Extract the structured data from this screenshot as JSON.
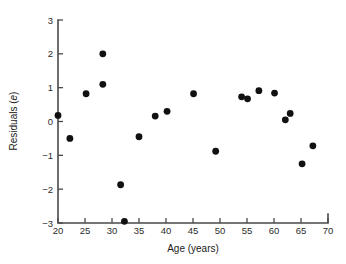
{
  "chart_data": {
    "type": "scatter",
    "title": "",
    "xlabel": "Age (years)",
    "ylabel": "Residuals (e)",
    "ylabel_plain": "Residuals (",
    "ylabel_italic": "e",
    "ylabel_close": ")",
    "xlim": [
      20,
      70
    ],
    "ylim": [
      -3,
      3
    ],
    "xticks": [
      20,
      25,
      30,
      35,
      40,
      45,
      50,
      55,
      60,
      65,
      70
    ],
    "xtick_labels": [
      "20",
      "25",
      "30",
      "35",
      "40",
      "45",
      "50",
      "55",
      "60",
      "65",
      "70"
    ],
    "yticks": [
      -3,
      -2,
      -1,
      0,
      1,
      2,
      3
    ],
    "ytick_labels": [
      "−3",
      "−2",
      "−1",
      "0",
      "1",
      "2",
      "3"
    ],
    "grid": false,
    "legend": false,
    "marker": "filled-circle",
    "marker_color": "#111111",
    "marker_size": 4.4,
    "x": [
      20.0,
      22.2,
      25.2,
      28.3,
      28.3,
      31.6,
      32.3,
      35.0,
      38.0,
      40.2,
      45.1,
      49.2,
      54.0,
      55.1,
      57.2,
      60.1,
      62.1,
      63.0,
      65.2,
      67.2
    ],
    "y": [
      0.18,
      -0.5,
      0.82,
      2.0,
      1.1,
      -1.87,
      -2.95,
      -0.45,
      0.16,
      0.3,
      0.82,
      -0.88,
      0.73,
      0.67,
      0.91,
      0.84,
      0.05,
      0.24,
      -1.25,
      -0.72
    ],
    "points": [
      {
        "x": 20.0,
        "y": 0.18
      },
      {
        "x": 22.2,
        "y": -0.5
      },
      {
        "x": 25.2,
        "y": 0.82
      },
      {
        "x": 28.3,
        "y": 2.0
      },
      {
        "x": 28.3,
        "y": 1.1
      },
      {
        "x": 31.6,
        "y": -1.87
      },
      {
        "x": 32.3,
        "y": -2.95
      },
      {
        "x": 35.0,
        "y": -0.45
      },
      {
        "x": 38.0,
        "y": 0.16
      },
      {
        "x": 40.2,
        "y": 0.3
      },
      {
        "x": 45.1,
        "y": 0.82
      },
      {
        "x": 49.2,
        "y": -0.88
      },
      {
        "x": 54.0,
        "y": 0.73
      },
      {
        "x": 55.1,
        "y": 0.67
      },
      {
        "x": 57.2,
        "y": 0.91
      },
      {
        "x": 60.1,
        "y": 0.84
      },
      {
        "x": 62.1,
        "y": 0.05
      },
      {
        "x": 63.0,
        "y": 0.24
      },
      {
        "x": 65.2,
        "y": -1.25
      },
      {
        "x": 67.2,
        "y": -0.72
      }
    ]
  },
  "layout": {
    "plot_left": 58,
    "plot_right": 328,
    "plot_top": 20,
    "plot_bottom": 223,
    "axis_color": "#4a4a4a",
    "background": "#ffffff"
  }
}
